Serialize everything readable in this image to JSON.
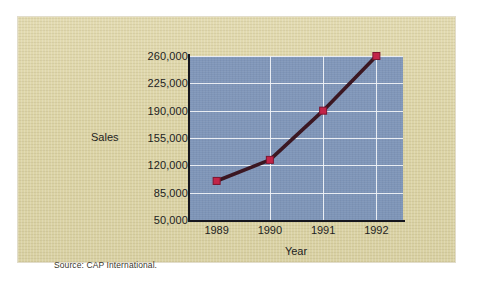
{
  "figure": {
    "source_note": "Source: CAP International.",
    "panel_color": "#ded7ab",
    "plot_color": "#7f96b9",
    "gridline_color": "#f2f4f7",
    "axis_color": "#16161e",
    "line_color": "#3b1722",
    "marker_color": "#c32448"
  },
  "chart_data": {
    "type": "line",
    "title": "",
    "xlabel": "Year",
    "ylabel": "Sales",
    "categories": [
      "1989",
      "1990",
      "1991",
      "1992"
    ],
    "x": [
      1989,
      1990,
      1991,
      1992
    ],
    "values": [
      100000,
      127000,
      190000,
      260000
    ],
    "series": [
      {
        "name": "Sales",
        "values": [
          100000,
          127000,
          190000,
          260000
        ]
      }
    ],
    "ylim": [
      50000,
      260000
    ],
    "yticks": [
      50000,
      85000,
      120000,
      155000,
      190000,
      225000,
      260000
    ],
    "ytick_labels": [
      "50,000",
      "85,000",
      "120,000",
      "155,000",
      "190,000",
      "225,000",
      "260,000"
    ],
    "xtick_labels": [
      "1989",
      "1990",
      "1991",
      "1992"
    ],
    "grid": true,
    "legend": null,
    "legend_position": "none",
    "marker": "square"
  }
}
